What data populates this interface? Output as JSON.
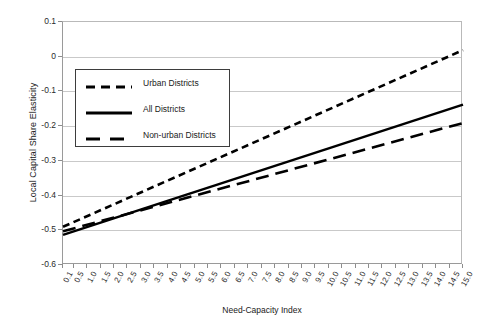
{
  "chart_data": {
    "type": "line",
    "title": "",
    "xlabel": "Need-Capacity Index",
    "ylabel": "Local Capital Share Elasticity",
    "xlim": [
      0.1,
      15.0
    ],
    "ylim": [
      -0.6,
      0.1
    ],
    "grid": "horizontal",
    "legend_position": "upper-left-inside",
    "ytick_labels": [
      "0.1",
      "0",
      "-0.1",
      "-0.2",
      "-0.3",
      "-0.4",
      "-0.5",
      "-0.6"
    ],
    "ytick_values": [
      0.1,
      0,
      -0.1,
      -0.2,
      -0.3,
      -0.4,
      -0.5,
      -0.6
    ],
    "xtick_labels": [
      "0.1",
      "0.5",
      "1.0",
      "1.5",
      "2.0",
      "2.5",
      "3.0",
      "3.5",
      "4.0",
      "4.5",
      "5.0",
      "5.5",
      "6.0",
      "6.5",
      "7.0",
      "7.5",
      "8.0",
      "8.5",
      "9.0",
      "9.5",
      "10.0",
      "10.5",
      "11.0",
      "11.5",
      "12.0",
      "12.5",
      "13.0",
      "13.5",
      "14.0",
      "14.5",
      "15.0"
    ],
    "xtick_values": [
      0.1,
      0.5,
      1.0,
      1.5,
      2.0,
      2.5,
      3.0,
      3.5,
      4.0,
      4.5,
      5.0,
      5.5,
      6.0,
      6.5,
      7.0,
      7.5,
      8.0,
      8.5,
      9.0,
      9.5,
      10.0,
      10.5,
      11.0,
      11.5,
      12.0,
      12.5,
      13.0,
      13.5,
      14.0,
      14.5,
      15.0
    ],
    "series": [
      {
        "name": "Urban Districts",
        "style": "short-dash",
        "color": "#000000",
        "x": [
          0.1,
          15.0
        ],
        "y": [
          -0.49,
          0.019
        ]
      },
      {
        "name": "All Districts",
        "style": "solid",
        "color": "#000000",
        "x": [
          0.1,
          15.0
        ],
        "y": [
          -0.513,
          -0.138
        ]
      },
      {
        "name": "Non-urban Districts",
        "style": "long-dash",
        "color": "#000000",
        "x": [
          0.1,
          15.0
        ],
        "y": [
          -0.503,
          -0.191
        ]
      }
    ]
  },
  "legend": {
    "entries": [
      {
        "label": "Urban Districts"
      },
      {
        "label": "All Districts"
      },
      {
        "label": "Non-urban Districts"
      }
    ]
  },
  "colors": {
    "line": "#000000",
    "grid": "#c9c9c9",
    "axis": "#8d8d8d",
    "background": "#ffffff"
  }
}
